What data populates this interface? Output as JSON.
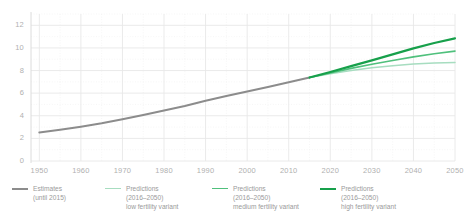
{
  "chart_data": {
    "type": "line",
    "title": "",
    "xlabel": "",
    "ylabel": "",
    "xlim": [
      1948,
      2050
    ],
    "ylim": [
      0,
      13
    ],
    "grid": true,
    "legend_position": "bottom",
    "xticks": [
      1950,
      1960,
      1970,
      1980,
      1990,
      2000,
      2010,
      2020,
      2030,
      2040,
      2050
    ],
    "yticks": [
      0,
      2,
      4,
      6,
      8,
      10,
      12
    ],
    "series": [
      {
        "name": "Estimates (until 2015)",
        "color": "#8c8c8c",
        "width": 2.0,
        "x": [
          1950,
          1955,
          1960,
          1965,
          1970,
          1975,
          1980,
          1985,
          1990,
          1995,
          2000,
          2005,
          2010,
          2015
        ],
        "values": [
          2.53,
          2.77,
          3.03,
          3.33,
          3.7,
          4.07,
          4.46,
          4.87,
          5.33,
          5.74,
          6.14,
          6.54,
          6.96,
          7.38
        ]
      },
      {
        "name": "Predictions (2016–2050) low fertility variant",
        "color": "#a7ddc0",
        "width": 1.5,
        "x": [
          2015,
          2020,
          2025,
          2030,
          2035,
          2040,
          2045,
          2050
        ],
        "values": [
          7.38,
          7.72,
          8.0,
          8.24,
          8.43,
          8.57,
          8.67,
          8.71
        ]
      },
      {
        "name": "Predictions (2016–2050) medium fertility variant",
        "color": "#4fc07c",
        "width": 1.6,
        "x": [
          2015,
          2020,
          2025,
          2030,
          2035,
          2040,
          2045,
          2050
        ],
        "values": [
          7.38,
          7.79,
          8.19,
          8.55,
          8.89,
          9.21,
          9.48,
          9.72
        ]
      },
      {
        "name": "Predictions (2016–2050) high fertility variant",
        "color": "#17a04b",
        "width": 2.2,
        "x": [
          2015,
          2020,
          2025,
          2030,
          2035,
          2040,
          2045,
          2050
        ],
        "values": [
          7.38,
          7.87,
          8.39,
          8.9,
          9.43,
          9.96,
          10.44,
          10.85
        ]
      }
    ]
  },
  "axes": {
    "y_labels": [
      "0",
      "2",
      "4",
      "6",
      "8",
      "10",
      "12"
    ],
    "x_labels": [
      "1950",
      "1960",
      "1970",
      "1980",
      "1990",
      "2000",
      "2010",
      "2020",
      "2030",
      "2040",
      "2050"
    ]
  },
  "legend": {
    "items": [
      {
        "line1": "Estimates",
        "line2": "(until 2015)",
        "line3": "",
        "color": "#8c8c8c",
        "width": "2px"
      },
      {
        "line1": "Predictions",
        "line2": "(2016–2050)",
        "line3": "low fertility variant",
        "color": "#a7ddc0",
        "width": "1.5px"
      },
      {
        "line1": "Predictions",
        "line2": "(2016–2050)",
        "line3": "medium fertility variant",
        "color": "#4fc07c",
        "width": "1.6px"
      },
      {
        "line1": "Predictions",
        "line2": "(2016–2050)",
        "line3": "high fertility variant",
        "color": "#17a04b",
        "width": "2.2px"
      }
    ]
  },
  "style": {
    "background": "#ffffff",
    "grid_major": "#e8e8e8",
    "grid_minor": "#f2f2f2",
    "axis_line": "#dcdcdc",
    "tick_text": "#b0b0b0",
    "legend_text": "#9a9a9a"
  }
}
